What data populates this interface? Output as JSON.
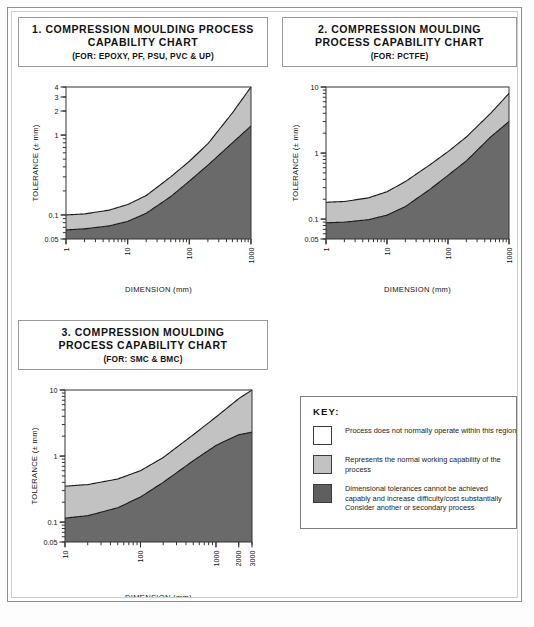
{
  "document": {
    "kind": "compression-moulding-process-capability-charts"
  },
  "colors": {
    "band_light": "#c2c2c2",
    "band_dark": "#6a6a6a",
    "band_white": "#ffffff",
    "curve_line": "#1a1a1a",
    "frame": "#8d8d8d"
  },
  "panels": [
    {
      "title_line1": "1. COMPRESSION MOULDING PROCESS",
      "title_line2": "CAPABILITY CHART",
      "subtitle": "(FOR: EPOXY, PF, PSU, PVC & UP)"
    },
    {
      "title_line1": "2.  COMPRESSION MOULDING",
      "title_line2": "PROCESS CAPABILITY CHART",
      "subtitle": "(FOR: PCTFE)"
    },
    {
      "title_line1": "3.  COMPRESSION MOULDING",
      "title_line2": "PROCESS CAPABILITY CHART",
      "subtitle": "(FOR: SMC & BMC)"
    }
  ],
  "key": {
    "title": "KEY:",
    "items": [
      {
        "swatch": "#ffffff",
        "lines": [
          "Process does not normally operate within this region"
        ]
      },
      {
        "swatch": "#c2c2c2",
        "lines": [
          "Represents the normal working capability of the",
          "process"
        ]
      },
      {
        "swatch": "#5f5f5f",
        "lines": [
          "Dimensional tolerances cannot be achieved",
          "capably and increase difficulty/cost substantially",
          "Consider another or secondary process"
        ]
      }
    ]
  },
  "chart_data": [
    {
      "id": "chart-1",
      "type": "area",
      "title": "1. COMPRESSION MOULDING PROCESS CAPABILITY CHART",
      "subtitle": "(FOR: EPOXY, PF, PSU, PVC & UP)",
      "xlabel": "DIMENSION (mm)",
      "ylabel": "TOLERANCE (± mm)",
      "xscale": "log",
      "yscale": "log",
      "xlim": [
        1,
        1000
      ],
      "ylim": [
        0.05,
        4
      ],
      "xticks": [
        1,
        10,
        100,
        1000
      ],
      "xticklabels": [
        "1",
        "10",
        "100",
        "1000"
      ],
      "yticks": [
        0.05,
        0.1,
        1,
        2,
        3,
        4
      ],
      "yticklabels": [
        "0.05",
        "0.1",
        "1",
        "2",
        "3",
        "4"
      ],
      "grid": false,
      "legend": "external-key",
      "series": [
        {
          "name": "upper boundary (white / normal-working)",
          "x": [
            1,
            2,
            5,
            10,
            20,
            50,
            100,
            200,
            500,
            1000
          ],
          "y": [
            0.1,
            0.103,
            0.115,
            0.135,
            0.175,
            0.3,
            0.47,
            0.78,
            1.9,
            4.0
          ]
        },
        {
          "name": "lower boundary (normal-working / not-capable)",
          "x": [
            1,
            2,
            5,
            10,
            20,
            50,
            100,
            200,
            500,
            1000
          ],
          "y": [
            0.065,
            0.067,
            0.073,
            0.083,
            0.105,
            0.17,
            0.265,
            0.42,
            0.8,
            1.3
          ]
        }
      ],
      "regions": [
        {
          "name": "Process does not normally operate within this region",
          "fill": "#ffffff"
        },
        {
          "name": "Represents the normal working capability of the process",
          "fill": "#c2c2c2"
        },
        {
          "name": "Dimensional tolerances cannot be achieved capably",
          "fill": "#6a6a6a"
        }
      ]
    },
    {
      "id": "chart-2",
      "type": "area",
      "title": "2. COMPRESSION MOULDING PROCESS CAPABILITY CHART",
      "subtitle": "(FOR: PCTFE)",
      "xlabel": "DIMENSION (mm)",
      "ylabel": "TOLERANCE (± mm)",
      "xscale": "log",
      "yscale": "log",
      "xlim": [
        1,
        1000
      ],
      "ylim": [
        0.05,
        10
      ],
      "xticks": [
        1,
        10,
        100,
        1000
      ],
      "xticklabels": [
        "1",
        "10",
        "100",
        "1000"
      ],
      "yticks": [
        0.05,
        0.1,
        1,
        10
      ],
      "yticklabels": [
        "0.05",
        "0.1",
        "1",
        "10"
      ],
      "grid": false,
      "legend": "external-key",
      "series": [
        {
          "name": "upper boundary (white / normal-working)",
          "x": [
            1,
            2,
            5,
            10,
            20,
            50,
            100,
            200,
            500,
            1000
          ],
          "y": [
            0.18,
            0.185,
            0.21,
            0.26,
            0.37,
            0.66,
            1.05,
            1.75,
            4.0,
            8.0
          ]
        },
        {
          "name": "lower boundary (normal-working / not-capable)",
          "x": [
            1,
            2,
            5,
            10,
            20,
            50,
            100,
            200,
            500,
            1000
          ],
          "y": [
            0.088,
            0.09,
            0.098,
            0.115,
            0.155,
            0.28,
            0.46,
            0.76,
            1.75,
            3.0
          ]
        }
      ],
      "regions": [
        {
          "name": "Process does not normally operate within this region",
          "fill": "#ffffff"
        },
        {
          "name": "Represents the normal working capability of the process",
          "fill": "#c2c2c2"
        },
        {
          "name": "Dimensional tolerances cannot be achieved capably",
          "fill": "#6a6a6a"
        }
      ]
    },
    {
      "id": "chart-3",
      "type": "area",
      "title": "3. COMPRESSION MOULDING PROCESS CAPABILITY CHART",
      "subtitle": "(FOR: SMC & BMC)",
      "xlabel": "DIMENSION (mm)",
      "ylabel": "TOLERANCE (± mm)",
      "xscale": "log",
      "yscale": "log",
      "xlim": [
        10,
        3000
      ],
      "ylim": [
        0.05,
        10
      ],
      "xticks": [
        10,
        100,
        1000,
        2000,
        3000
      ],
      "xticklabels": [
        "10",
        "100",
        "1000",
        "2000",
        "3000"
      ],
      "yticks": [
        0.05,
        0.1,
        1,
        10
      ],
      "yticklabels": [
        "0.05",
        "0.1",
        "1",
        "10"
      ],
      "grid": false,
      "legend": "external-key",
      "series": [
        {
          "name": "upper boundary (white / normal-working)",
          "x": [
            10,
            20,
            50,
            100,
            200,
            500,
            1000,
            2000,
            3000
          ],
          "y": [
            0.35,
            0.37,
            0.45,
            0.6,
            0.95,
            2.1,
            3.9,
            7.4,
            10.0
          ]
        },
        {
          "name": "lower boundary (normal-working / not-capable)",
          "x": [
            10,
            20,
            50,
            100,
            200,
            500,
            1000,
            2000,
            3000
          ],
          "y": [
            0.115,
            0.125,
            0.165,
            0.24,
            0.4,
            0.85,
            1.45,
            2.1,
            2.3
          ]
        }
      ],
      "regions": [
        {
          "name": "Process does not normally operate within this region",
          "fill": "#ffffff"
        },
        {
          "name": "Represents the normal working capability of the process",
          "fill": "#c2c2c2"
        },
        {
          "name": "Dimensional tolerances cannot be achieved capably",
          "fill": "#6a6a6a"
        }
      ]
    }
  ]
}
